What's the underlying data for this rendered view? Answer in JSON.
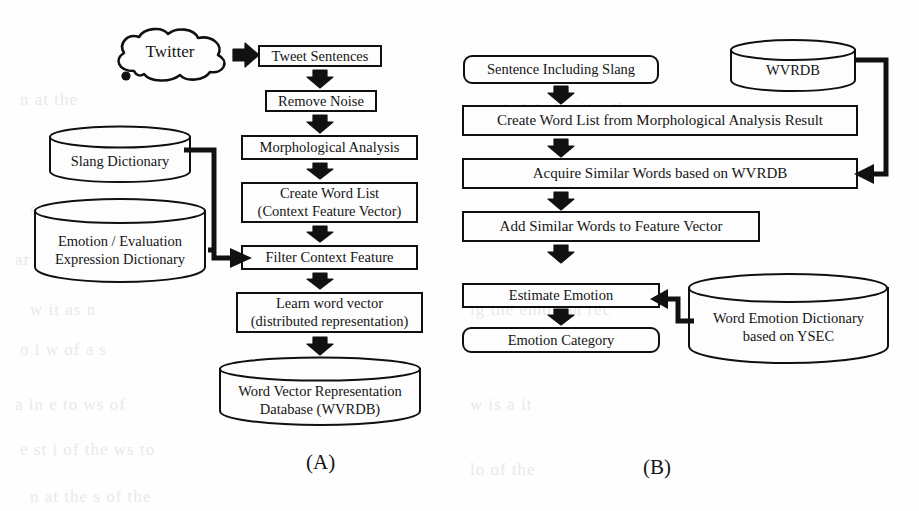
{
  "figure": {
    "panels": [
      {
        "id": "A",
        "caption": "(A)",
        "source_cloud": {
          "label": "Twitter"
        },
        "steps": [
          {
            "id": "tweet-sentences",
            "label": "Tweet Sentences"
          },
          {
            "id": "remove-noise",
            "label": "Remove Noise"
          },
          {
            "id": "morphological",
            "label": "Morphological Analysis"
          },
          {
            "id": "create-word-list",
            "line1": "Create Word List",
            "line2": "(Context Feature Vector)"
          },
          {
            "id": "filter-context",
            "label": "Filter Context Feature"
          },
          {
            "id": "learn-word-vector",
            "line1": "Learn word vector",
            "line2": "(distributed representation)"
          }
        ],
        "databases": [
          {
            "id": "slang-dictionary",
            "line1": "Slang Dictionary",
            "line2": ""
          },
          {
            "id": "emotion-dictionary",
            "line1": "Emotion / Evaluation",
            "line2": "Expression Dictionary"
          },
          {
            "id": "wvrdb-output",
            "line1": "Word Vector Representation",
            "line2": "Database (WVRDB)"
          }
        ]
      },
      {
        "id": "B",
        "caption": "(B)",
        "steps": [
          {
            "id": "sentence-including-slang",
            "label": "Sentence Including Slang"
          },
          {
            "id": "create-word-list-ma",
            "label": "Create Word List from Morphological Analysis Result"
          },
          {
            "id": "acquire-similar-words",
            "label": "Acquire Similar Words based on WVRDB"
          },
          {
            "id": "add-similar-words",
            "label": "Add Similar Words to Feature Vector"
          },
          {
            "id": "estimate-emotion",
            "label": "Estimate Emotion"
          },
          {
            "id": "emotion-category",
            "label": "Emotion Category"
          }
        ],
        "databases": [
          {
            "id": "wvrdb-input",
            "line1": "WVRDB",
            "line2": ""
          },
          {
            "id": "word-emotion-dictionary",
            "line1": "Word Emotion Dictionary",
            "line2": "based on YSEC"
          }
        ]
      }
    ]
  },
  "colors": {
    "stroke": "#101010",
    "fill": "#fdfdfd",
    "arrow": "#111111",
    "background": "#fefefe"
  },
  "bleed_text": [
    {
      "text": "n  at  the",
      "x": 20,
      "y": 90
    },
    {
      "text": "a  st  in  W,  the  distribution",
      "x": 470,
      "y": 100
    },
    {
      "text": "sec  the  of  i",
      "x": 30,
      "y": 200
    },
    {
      "text": "tion  w  ith  an  in",
      "x": 470,
      "y": 215
    },
    {
      "text": "ar  of",
      "x": 15,
      "y": 250
    },
    {
      "text": "w  it  as  n",
      "x": 30,
      "y": 300
    },
    {
      "text": "lg  the  emotion  rec",
      "x": 470,
      "y": 300
    },
    {
      "text": "o  i  w  of  a  s",
      "x": 20,
      "y": 340
    },
    {
      "text": "a  in  e  to  ws  of",
      "x": 15,
      "y": 395
    },
    {
      "text": "w  is  a  it",
      "x": 470,
      "y": 395
    },
    {
      "text": "e  st  i  of  the  ws  to",
      "x": 20,
      "y": 440
    },
    {
      "text": "lo  of  the",
      "x": 470,
      "y": 460
    },
    {
      "text": "n  at  the  s  of  the",
      "x": 30,
      "y": 487
    }
  ]
}
